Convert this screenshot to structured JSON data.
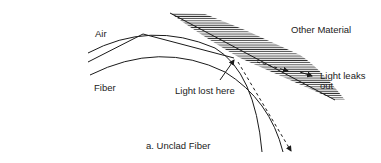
{
  "figure": {
    "caption": "a. Unclad Fiber",
    "labels": {
      "air": "Air",
      "fiber": "Fiber",
      "other_material": "Other Material",
      "light_lost": "Light lost here",
      "light_leaks_line1": "Light leaks",
      "light_leaks_line2": "out"
    },
    "colors": {
      "line": "#1a1a1a",
      "hatch": "#333333",
      "text": "#222222",
      "background": "#ffffff"
    }
  }
}
